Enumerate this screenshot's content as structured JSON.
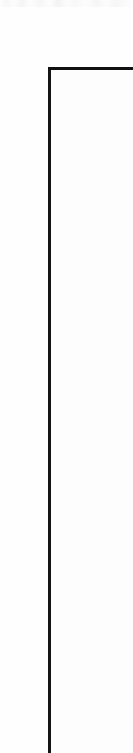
{
  "page": {
    "width": 133,
    "height": 753,
    "background_color": "#fefefe",
    "ink_color": "#0b0b0b",
    "rule_color": "#111111"
  },
  "heading": {
    "label": "問題 9",
    "reading": "Mondai 9",
    "translation": "Question 9",
    "orientation": "rotated-90-ccw",
    "section_number": "9"
  },
  "frame": {
    "name": "content-frame",
    "corner_x": 48,
    "corner_y": 67,
    "rule_thickness": "3px",
    "top_rule_color": "#111111",
    "left_rule_color": "#141414"
  },
  "scan": {
    "edge_artifact": "top-edge-bleed"
  }
}
